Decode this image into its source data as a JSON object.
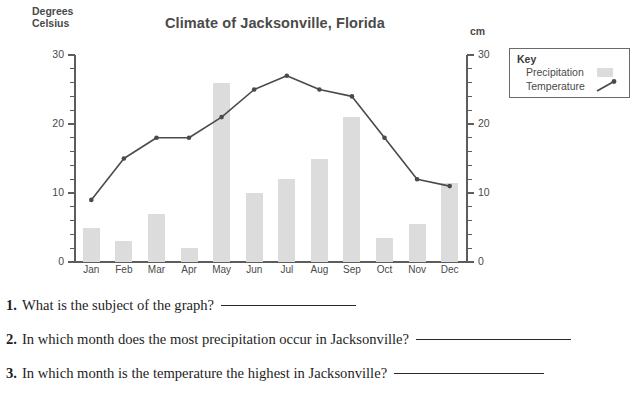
{
  "chart_data": {
    "type": "bar",
    "title": "Climate of Jacksonville, Florida",
    "categories": [
      "Jan",
      "Feb",
      "Mar",
      "Apr",
      "May",
      "Jun",
      "Jul",
      "Aug",
      "Sep",
      "Oct",
      "Nov",
      "Dec"
    ],
    "series": [
      {
        "name": "Precipitation",
        "type": "bar",
        "unit": "cm",
        "axis": "right",
        "values": [
          5,
          3,
          7,
          2,
          26,
          10,
          12,
          15,
          21,
          3.5,
          5.5,
          11.5
        ]
      },
      {
        "name": "Temperature",
        "type": "line",
        "unit": "Degrees Celsius",
        "axis": "left",
        "values": [
          9,
          15,
          18,
          18,
          21,
          25,
          27,
          25,
          24,
          18,
          12,
          11
        ]
      }
    ],
    "xlabel": "",
    "ylabel": "Degrees Celsius",
    "y2label": "cm",
    "ylim": [
      0,
      30
    ],
    "y2lim": [
      0,
      30
    ],
    "yticks": [
      0,
      10,
      20,
      30
    ],
    "y2ticks": [
      0,
      10,
      20,
      30
    ],
    "minor_tick_step": 2,
    "grid": false,
    "legend_position": "top-right",
    "colors": {
      "bar": "#dcdcdc",
      "line": "#4a4a4a",
      "axis": "#5d5d5d",
      "text": "#4a4a4a"
    }
  },
  "chart": {
    "title": "Climate of Jacksonville, Florida",
    "y_left_title_line1": "Degrees",
    "y_left_title_line2": "Celsius",
    "y_right_title": "cm"
  },
  "legend": {
    "title": "Key",
    "precipitation_label": "Precipitation",
    "temperature_label": "Temperature"
  },
  "questions": [
    {
      "number": "1.",
      "text": "What is the subject of the graph?",
      "rule_width": 135
    },
    {
      "number": "2.",
      "text": "In which month does the most precipitation occur in Jacksonville?",
      "rule_width": 155
    },
    {
      "number": "3.",
      "text": "In which month is the temperature the highest in Jacksonville?",
      "rule_width": 150
    }
  ]
}
